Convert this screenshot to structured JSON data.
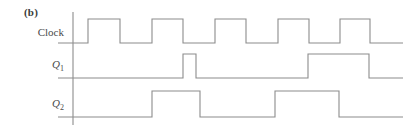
{
  "figure": {
    "label": "(b)",
    "caption": ""
  },
  "rows": [
    {
      "name": "clock",
      "label": "Clock",
      "label_sub": ""
    },
    {
      "name": "q1",
      "label": "Q",
      "label_sub": "1"
    },
    {
      "name": "q2",
      "label": "Q",
      "label_sub": "2"
    }
  ],
  "colors": {
    "line": "#8c8c8c",
    "text": "#4a4a4a",
    "background": "#ffffff"
  },
  "chart_data": {
    "type": "line",
    "title": "(b)",
    "xlabel": "",
    "ylabel": "",
    "grid": false,
    "legend": "none",
    "axis": {
      "x": 73,
      "y_top": 12,
      "y_bottom": 125
    },
    "xlim": [
      73,
      403
    ],
    "series": [
      {
        "name": "Clock",
        "baseline_y": 43,
        "high_y": 19,
        "pulses": [
          [
            88,
            120
          ],
          [
            152,
            183
          ],
          [
            215,
            246
          ],
          [
            278,
            309
          ],
          [
            340,
            370
          ]
        ],
        "end_x": 403
      },
      {
        "name": "Q1",
        "baseline_y": 78,
        "high_y": 54,
        "pulses": [
          [
            183,
            196
          ],
          [
            308,
            369
          ]
        ],
        "end_x": 403
      },
      {
        "name": "Q2",
        "baseline_y": 117,
        "high_y": 91,
        "pulses": [
          [
            152,
            200
          ],
          [
            275,
            339
          ]
        ],
        "end_x": 403
      }
    ]
  }
}
